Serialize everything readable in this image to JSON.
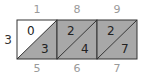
{
  "problem": {
    "multiplicand_digits": [
      "1",
      "8",
      "9"
    ],
    "multiplier": "3",
    "result_digits": [
      "5",
      "6",
      "7"
    ]
  },
  "cells": [
    {
      "tens": "0",
      "ones": "3",
      "tens_shaded": false
    },
    {
      "tens": "2",
      "ones": "4",
      "tens_shaded": true
    },
    {
      "tens": "2",
      "ones": "7",
      "tens_shaded": true
    }
  ],
  "colors": {
    "shade": "#a8a8a8",
    "white": "#ffffff",
    "line": "#333333",
    "label_gray": "#9a9a9a"
  }
}
